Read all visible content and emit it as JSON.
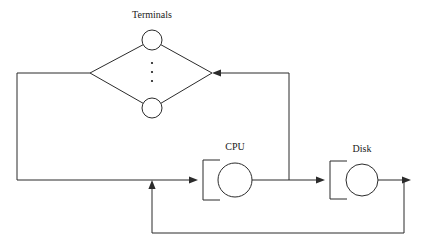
{
  "diagram": {
    "title": "",
    "type": "queueing-network",
    "width": 431,
    "height": 245,
    "background_color": "#ffffff",
    "line_color": "#2b2b2b",
    "text_color": "#1a1a1a",
    "labels": {
      "terminals": "Terminals",
      "cpu": "CPU",
      "disk": "Disk"
    },
    "nodes": [
      {
        "id": "terminal-top",
        "kind": "circle",
        "label": "Terminals",
        "cx": 152,
        "cy": 40,
        "r": 10,
        "label_x": 152,
        "label_y": 18
      },
      {
        "id": "terminal-bottom",
        "kind": "circle",
        "label": "",
        "cx": 152,
        "cy": 108,
        "r": 10
      },
      {
        "id": "cpu",
        "kind": "queue-server",
        "label": "CPU",
        "cx": 235,
        "cy": 180,
        "r": 17,
        "queue_x": 203,
        "queue_top": 160,
        "queue_bottom": 200,
        "label_x": 235,
        "label_y": 150
      },
      {
        "id": "disk",
        "kind": "queue-server",
        "label": "Disk",
        "cx": 362,
        "cy": 180,
        "r": 16,
        "queue_x": 330,
        "queue_top": 161,
        "queue_bottom": 199,
        "label_x": 362,
        "label_y": 152
      }
    ],
    "ellipsis": {
      "id": "terminals-ellipsis",
      "cx": 152,
      "dots_y": [
        63,
        72,
        81
      ],
      "r": 1.1
    },
    "edges": [
      {
        "id": "terminals-fanout-left-top",
        "from": "terminal-top",
        "to": "diamond-left-vertex",
        "arrow": false
      },
      {
        "id": "terminals-fanout-right-top",
        "from": "terminal-top",
        "to": "diamond-right-vertex",
        "arrow": false
      },
      {
        "id": "terminals-fanin-left-bottom",
        "from": "diamond-left-vertex",
        "to": "terminal-bottom",
        "arrow": false
      },
      {
        "id": "terminals-fanin-right-bottom",
        "from": "diamond-right-vertex",
        "to": "terminal-bottom",
        "arrow": false
      },
      {
        "id": "terminals-to-cpu",
        "from": "diamond-left-vertex",
        "to": "cpu",
        "arrow": true,
        "arrow_dir": "right"
      },
      {
        "id": "cpu-to-disk",
        "from": "cpu",
        "to": "disk",
        "arrow": true,
        "arrow_dir": "right"
      },
      {
        "id": "cpu-to-terminals",
        "from": "cpu",
        "to": "diamond-right-vertex",
        "arrow": true,
        "arrow_dir": "left"
      },
      {
        "id": "disk-to-cpu",
        "from": "disk",
        "to": "cpu",
        "arrow": true,
        "arrow_dir": "up"
      },
      {
        "id": "disk-exit",
        "from": "disk",
        "to": "disk-feedback-corner",
        "arrow": true,
        "arrow_dir": "right"
      }
    ]
  }
}
